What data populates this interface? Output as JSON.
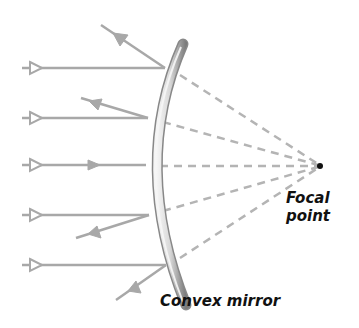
{
  "diagram": {
    "labels": {
      "focal_line1": "Focal",
      "focal_line2": "point",
      "mirror": "Convex mirror"
    },
    "colors": {
      "ray": "#a8a8a8",
      "dashed": "#b4b4b4",
      "mirror_light": "#e8e8e8",
      "mirror_dark": "#8c8c8c",
      "focal_point": "#111111",
      "text": "#111111"
    },
    "focal_point": {
      "x": 320,
      "y": 166
    },
    "incident_rays": [
      {
        "y": 68,
        "hit_x": 165,
        "reflect_to": [
          101,
          25
        ]
      },
      {
        "y": 118,
        "hit_x": 148,
        "reflect_to": [
          81,
          98
        ]
      },
      {
        "y": 165,
        "hit_x": 146,
        "reflect_to": [
          146,
          165
        ]
      },
      {
        "y": 215,
        "hit_x": 149,
        "reflect_to": [
          76,
          238
        ]
      },
      {
        "y": 265,
        "hit_x": 166,
        "reflect_to": [
          116,
          300
        ]
      }
    ]
  }
}
